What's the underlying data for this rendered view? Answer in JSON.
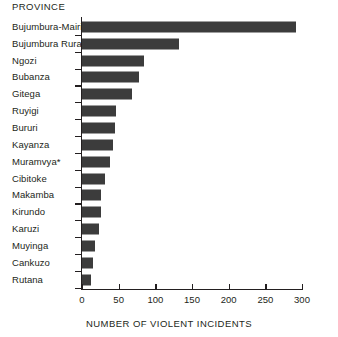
{
  "chart_data": {
    "type": "bar",
    "orientation": "horizontal",
    "title": "",
    "ylabel": "PROVINCE",
    "xlabel": "NUMBER OF VIOLENT INCIDENTS",
    "xlim": [
      0,
      300
    ],
    "xticks": [
      0,
      50,
      100,
      150,
      200,
      250,
      300
    ],
    "xtick_labels": [
      "0",
      "50",
      "100",
      "150",
      "200",
      "250",
      "300"
    ],
    "grid": false,
    "legend": null,
    "bar_color": "#3c3c3c",
    "axis_color": "#231f20",
    "background": "#ffffff",
    "categories": [
      "Bujumbura-Mairie",
      "Bujumbura Rural",
      "Ngozi",
      "Bubanza",
      "Gitega",
      "Ruyigi",
      "Bururi",
      "Kayanza",
      "Muramvya*",
      "Cibitoke",
      "Makamba",
      "Kirundo",
      "Karuzi",
      "Muyinga",
      "Cankuzo",
      "Rutana"
    ],
    "values": [
      292,
      132,
      85,
      78,
      68,
      46,
      45,
      42,
      38,
      31,
      26,
      26,
      23,
      18,
      15,
      12
    ],
    "footnote_marker": "*"
  }
}
